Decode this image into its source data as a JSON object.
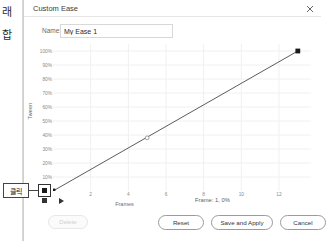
{
  "background": {
    "korean_fragment_1": "래",
    "korean_fragment_2": "합"
  },
  "annotation": {
    "label": "클릭"
  },
  "dialog": {
    "title": "Custom Ease",
    "close_icon": "close-icon",
    "name": {
      "label": "Name:",
      "value": "My Ease 1",
      "placeholder": "My Ease 1"
    },
    "footer": {
      "delete_label": "Delete",
      "reset_label": "Reset",
      "save_and_apply_label": "Save and Apply",
      "cancel_label": "Cancel"
    },
    "transport": {
      "stop_icon": "stop-icon",
      "play_icon": "play-icon"
    },
    "status": "Frame: 1,  0%"
  },
  "chart_data": {
    "type": "line",
    "title": "",
    "xlabel": "Frames",
    "ylabel": "Tween",
    "xlim": [
      0,
      13.7
    ],
    "ylim": [
      0,
      105
    ],
    "grid": true,
    "legend": "none",
    "xticks": [
      2,
      4,
      6,
      8,
      10,
      12
    ],
    "xtick_labels": [
      "2",
      "4",
      "6",
      "8",
      "10",
      "12"
    ],
    "yticks": [
      10,
      20,
      30,
      40,
      50,
      60,
      70,
      80,
      90,
      100
    ],
    "ytick_labels": [
      "10%",
      "20%",
      "30%",
      "40%",
      "50%",
      "60%",
      "70%",
      "80%",
      "90%",
      "100%"
    ],
    "series": [
      {
        "name": "Custom Ease Curve",
        "x": [
          0,
          13
        ],
        "values": [
          0,
          100
        ]
      }
    ],
    "control_points": [
      {
        "name": "start-handle",
        "x": 0,
        "y": 0,
        "marker": "filled-square",
        "color": "#1a1a1a"
      },
      {
        "name": "mid-point",
        "x": 5.0,
        "y": 38,
        "marker": "open-circle",
        "color": "#7a7a7a"
      },
      {
        "name": "end-handle",
        "x": 13,
        "y": 100,
        "marker": "filled-square",
        "color": "#1a1a1a"
      }
    ],
    "line_color": "#4a4a4a",
    "grid_color": "#f0f0f0"
  },
  "colors": {
    "dialog_bg": "#ffffff",
    "border": "#cfcfcf",
    "text": "#333333",
    "muted_text": "#8a8a8a",
    "accent": "#1a1a1a"
  }
}
